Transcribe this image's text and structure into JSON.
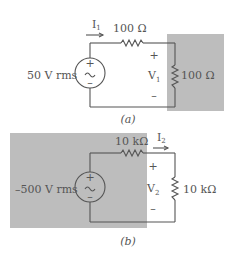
{
  "figure": {
    "colors": {
      "wire": "#555555",
      "text": "#555555",
      "shade": "#bdbdbd"
    },
    "circuit_a": {
      "caption": "(a)",
      "source_label": "50 V rms",
      "source_plus": "+",
      "source_minus": "–",
      "current_label": "I",
      "current_sub": "1",
      "series_resistor": "100 Ω",
      "load_resistor": "100 Ω",
      "voltage_label": "V",
      "voltage_sub": "1",
      "voltage_plus": "+",
      "voltage_minus": "–"
    },
    "circuit_b": {
      "caption": "(b)",
      "source_label": "–500 V rms",
      "source_plus": "+",
      "source_minus": "–",
      "current_label": "I",
      "current_sub": "2",
      "series_resistor": "10 kΩ",
      "load_resistor": "10 kΩ",
      "voltage_label": "V",
      "voltage_sub": "2",
      "voltage_plus": "+",
      "voltage_minus": "–"
    }
  }
}
